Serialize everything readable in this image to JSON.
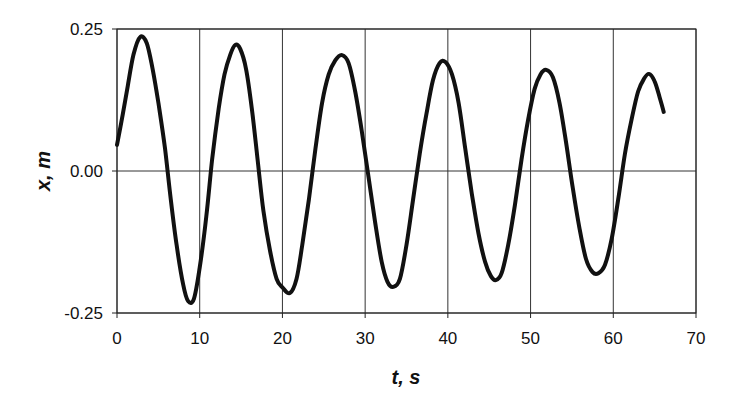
{
  "chart_data": {
    "type": "line",
    "title": "",
    "xlabel": "t, s",
    "ylabel": "x, m",
    "xlim": [
      0,
      70
    ],
    "ylim": [
      -0.25,
      0.25
    ],
    "x_ticks": [
      0,
      10,
      20,
      30,
      40,
      50,
      60,
      70
    ],
    "x_tick_labels": [
      "0",
      "10",
      "20",
      "30",
      "40",
      "50",
      "60",
      "70"
    ],
    "y_ticks": [
      -0.25,
      0.0,
      0.25
    ],
    "y_tick_labels": [
      "-0.25",
      "0.00",
      "0.25"
    ],
    "grid": true,
    "legend": null,
    "series": [
      {
        "name": "x(t)",
        "color": "#111111",
        "x": [
          0,
          0.7,
          1.3,
          2.0,
          2.8,
          3.6,
          4.3,
          5.0,
          5.8,
          6.5,
          7.2,
          8.0,
          8.6,
          9.3,
          10.0,
          10.8,
          11.5,
          12.3,
          13.0,
          13.7,
          14.3,
          14.9,
          15.6,
          16.3,
          17.0,
          17.7,
          18.5,
          19.3,
          20.0,
          20.9,
          21.7,
          22.4,
          23.2,
          24.0,
          24.8,
          25.6,
          26.4,
          27.2,
          28.0,
          28.8,
          29.6,
          30.4,
          31.2,
          32.0,
          32.7,
          33.4,
          34.2,
          35.0,
          35.8,
          36.6,
          37.4,
          38.2,
          39.0,
          39.7,
          40.5,
          41.3,
          42.1,
          42.9,
          43.7,
          44.5,
          45.2,
          45.8,
          46.5,
          47.3,
          48.1,
          48.9,
          49.7,
          50.5,
          51.2,
          51.9,
          52.7,
          53.5,
          54.3,
          55.1,
          55.9,
          56.7,
          57.5,
          58.2,
          59.0,
          59.8,
          60.6,
          61.4,
          62.2,
          63.0,
          63.7,
          64.3,
          65.0,
          65.6,
          66.1
        ],
        "y": [
          0.046,
          0.1,
          0.15,
          0.205,
          0.236,
          0.225,
          0.18,
          0.12,
          0.04,
          -0.05,
          -0.13,
          -0.2,
          -0.229,
          -0.225,
          -0.17,
          -0.08,
          0.02,
          0.11,
          0.17,
          0.205,
          0.222,
          0.215,
          0.18,
          0.11,
          0.02,
          -0.07,
          -0.14,
          -0.19,
          -0.205,
          -0.215,
          -0.19,
          -0.13,
          -0.05,
          0.04,
          0.12,
          0.17,
          0.195,
          0.204,
          0.19,
          0.14,
          0.07,
          -0.01,
          -0.09,
          -0.16,
          -0.195,
          -0.204,
          -0.19,
          -0.13,
          -0.05,
          0.03,
          0.1,
          0.16,
          0.19,
          0.192,
          0.17,
          0.12,
          0.04,
          -0.04,
          -0.11,
          -0.16,
          -0.185,
          -0.192,
          -0.18,
          -0.13,
          -0.06,
          0.02,
          0.09,
          0.145,
          0.17,
          0.178,
          0.165,
          0.12,
          0.05,
          -0.03,
          -0.1,
          -0.155,
          -0.178,
          -0.18,
          -0.165,
          -0.12,
          -0.05,
          0.03,
          0.09,
          0.14,
          0.162,
          0.171,
          0.158,
          0.13,
          0.104
        ]
      }
    ]
  },
  "layout": {
    "plot": {
      "left": 117,
      "top": 29,
      "right": 696,
      "bottom": 313
    },
    "line_color": "#111111",
    "grid_color": "#333333"
  }
}
